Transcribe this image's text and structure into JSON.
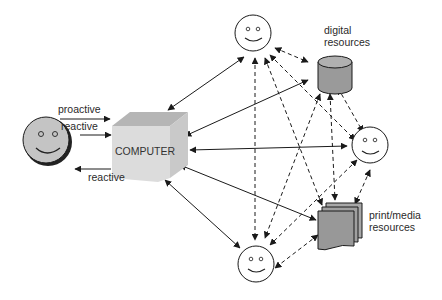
{
  "diagram": {
    "type": "information-flow",
    "nodes": {
      "user": {
        "label": "",
        "kind": "smiley-shaded"
      },
      "computer": {
        "label": "COMPUTER",
        "kind": "cube"
      },
      "person_top": {
        "label": "",
        "kind": "smiley"
      },
      "person_right": {
        "label": "",
        "kind": "smiley"
      },
      "person_bottom": {
        "label": "",
        "kind": "smiley"
      },
      "digital": {
        "label_line1": "digital",
        "label_line2": "resources",
        "kind": "cylinder"
      },
      "print": {
        "label_line1": "print/media",
        "label_line2": "resources",
        "kind": "document-stack"
      }
    },
    "user_links": [
      {
        "label": "proactive",
        "direction": "user-to-computer"
      },
      {
        "label": "reactive",
        "direction": "user-to-computer"
      },
      {
        "label": "reactive",
        "direction": "computer-to-user"
      }
    ],
    "edges": [
      {
        "from": "computer",
        "to": "person_top",
        "style": "solid",
        "arrows": "both"
      },
      {
        "from": "digital",
        "to": "computer",
        "style": "solid",
        "arrows": "both"
      },
      {
        "from": "computer",
        "to": "person_right",
        "style": "solid",
        "arrows": "both"
      },
      {
        "from": "computer",
        "to": "print",
        "style": "solid",
        "arrows": "both"
      },
      {
        "from": "computer",
        "to": "person_bottom",
        "style": "solid",
        "arrows": "both"
      },
      {
        "from": "person_top",
        "to": "digital",
        "style": "dashed",
        "arrows": "both"
      },
      {
        "from": "person_top",
        "to": "person_right",
        "style": "dashed",
        "arrows": "both"
      },
      {
        "from": "person_top",
        "to": "print",
        "style": "dashed",
        "arrows": "both"
      },
      {
        "from": "person_top",
        "to": "person_bottom",
        "style": "dashed",
        "arrows": "both"
      },
      {
        "from": "digital",
        "to": "person_right",
        "style": "dashed",
        "arrows": "both"
      },
      {
        "from": "digital",
        "to": "person_bottom",
        "style": "dashed",
        "arrows": "both"
      },
      {
        "from": "digital",
        "to": "print",
        "style": "dashed",
        "arrows": "both"
      },
      {
        "from": "person_right",
        "to": "print",
        "style": "dashed",
        "arrows": "both"
      },
      {
        "from": "person_right",
        "to": "person_bottom",
        "style": "dashed",
        "arrows": "both"
      },
      {
        "from": "print",
        "to": "person_bottom",
        "style": "dashed",
        "arrows": "both"
      }
    ],
    "colors": {
      "line": "#1a1a1a",
      "cube_front": "#dcdcdc",
      "cube_top": "#b5b5b5",
      "cube_side": "#c9c9c9",
      "user_face": "#c4c4c4",
      "resource_fill": "#9a9a9a"
    }
  }
}
